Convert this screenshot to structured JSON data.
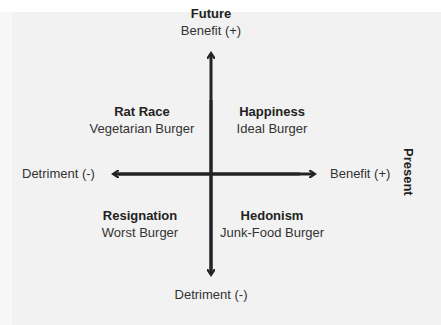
{
  "diagram": {
    "type": "quadrant",
    "vertical_axis": {
      "name": "Future",
      "top_label": "Benefit (+)",
      "bottom_label": "Detriment (-)"
    },
    "horizontal_axis": {
      "name": "Present",
      "left_label": "Detriment (-)",
      "right_label": "Benefit (+)"
    },
    "quadrants": [
      {
        "position": "top-left",
        "title": "Rat Race",
        "subtitle": "Vegetarian Burger"
      },
      {
        "position": "top-right",
        "title": "Happiness",
        "subtitle": "Ideal Burger"
      },
      {
        "position": "bottom-left",
        "title": "Resignation",
        "subtitle": "Worst Burger"
      },
      {
        "position": "bottom-right",
        "title": "Hedonism",
        "subtitle": "Junk-Food Burger"
      }
    ],
    "colors": {
      "background": "#f2f2f2",
      "axis": "#222222",
      "text": "#333333"
    }
  }
}
